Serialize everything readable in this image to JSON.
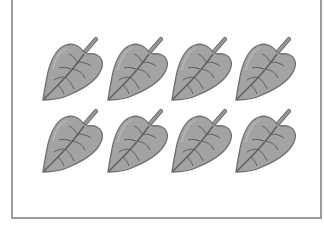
{
  "figure": {
    "rows": 2,
    "columns": 4,
    "total_leaves": 8,
    "leaf_icon": "leaf-icon"
  },
  "colors": {
    "leaf_fill": "#a3a3a3",
    "leaf_outline": "#6f6f6f",
    "leaf_vein": "#5c5c5c",
    "stem": "#8a8a8a",
    "frame_border": "#9c9c9c",
    "background": "#ffffff"
  },
  "leaves": [
    {
      "row": 1,
      "col": 1,
      "x": 39,
      "y": 36
    },
    {
      "row": 1,
      "col": 2,
      "x": 104,
      "y": 36
    },
    {
      "row": 1,
      "col": 3,
      "x": 168,
      "y": 36
    },
    {
      "row": 1,
      "col": 4,
      "x": 232,
      "y": 36
    },
    {
      "row": 2,
      "col": 1,
      "x": 39,
      "y": 108
    },
    {
      "row": 2,
      "col": 2,
      "x": 104,
      "y": 108
    },
    {
      "row": 2,
      "col": 3,
      "x": 168,
      "y": 108
    },
    {
      "row": 2,
      "col": 4,
      "x": 232,
      "y": 108
    }
  ]
}
